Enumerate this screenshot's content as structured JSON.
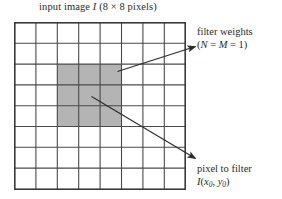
{
  "figure": {
    "title_prefix": "input image ",
    "title_symbol": "I",
    "title_suffix": " (8 × 8 pixels)",
    "title_full": "input image I (8 × 8 pixels)"
  },
  "grid": {
    "columns": 8,
    "rows": 8,
    "line_color": "#4a4a4a",
    "border_color": "#3a3a3a",
    "cell_fill": "#ffffff",
    "highlight_fill": "#b4b4b4",
    "highlight_start_col": 3,
    "highlight_start_row": 3,
    "highlight_cols": 3,
    "highlight_rows": 3
  },
  "annotations": {
    "filter_weights": {
      "line1": "filter weights",
      "line2_open": "(",
      "line2_n": "N",
      "line2_eq1": " = ",
      "line2_m": "M",
      "line2_eq2": " = 1)",
      "line2_full": "(N = M = 1)"
    },
    "pixel_to_filter": {
      "line1": "pixel to filter",
      "line2_symbol": "I",
      "line2_open": "(",
      "line2_x": "x",
      "line2_xsub": "0",
      "line2_comma": ", ",
      "line2_y": "y",
      "line2_ysub": "0",
      "line2_close": ")",
      "line2_full": "I(x0, y0)"
    }
  },
  "colors": {
    "ink": "#2b2b2b",
    "arrow": "#2b2b2b",
    "highlight": "#b4b4b4"
  }
}
